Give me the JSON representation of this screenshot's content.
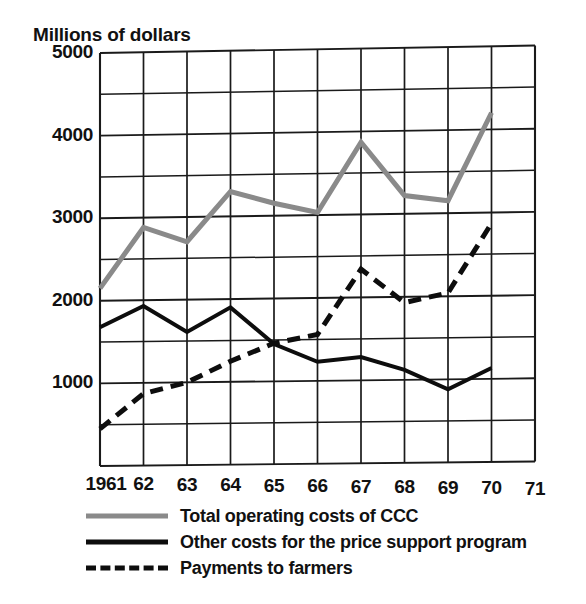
{
  "figure": {
    "axis_title": "Millions of dollars"
  },
  "chart_data": {
    "type": "line",
    "title": "",
    "subtitle": "",
    "xlabel": "",
    "ylabel": "Millions of dollars",
    "grid": true,
    "legend_position": "bottom",
    "xlim": [
      1961,
      1971
    ],
    "ylim": [
      0,
      5000
    ],
    "y_ticks": [
      5000,
      4000,
      3000,
      2000,
      1000
    ],
    "y_tick_labels": [
      "5000",
      "4000",
      "3000",
      "2000",
      "1000"
    ],
    "y_gridline_step": 500,
    "x": [
      1961,
      1962,
      1963,
      1964,
      1965,
      1966,
      1967,
      1968,
      1969,
      1970
    ],
    "x_ticks": [
      1961,
      1962,
      1963,
      1964,
      1965,
      1966,
      1967,
      1968,
      1969,
      1970,
      1971
    ],
    "x_tick_labels": [
      "1961",
      "62",
      "63",
      "64",
      "65",
      "66",
      "67",
      "68",
      "69",
      "70",
      "71"
    ],
    "series": [
      {
        "name": "Total operating costs of CCC",
        "style": "solid",
        "color": "#8a8a8a",
        "width": 5,
        "values": [
          2150,
          2880,
          2700,
          3300,
          3150,
          3030,
          3870,
          3220,
          3150,
          4200
        ]
      },
      {
        "name": "Other costs for the price support program",
        "style": "solid",
        "color": "#0d0d0d",
        "width": 4,
        "values": [
          1680,
          1930,
          1610,
          1900,
          1450,
          1230,
          1280,
          1120,
          880,
          1130
        ]
      },
      {
        "name": "Payments to farmers",
        "style": "dashed",
        "color": "#0d0d0d",
        "width": 5,
        "values": [
          450,
          870,
          1000,
          1250,
          1460,
          1560,
          2340,
          1930,
          2040,
          2870
        ]
      }
    ]
  },
  "legend": {
    "items": [
      {
        "label": "Total operating costs of CCC",
        "swatch": "gray-solid-line-swatch"
      },
      {
        "label": "Other costs for the price support program",
        "swatch": "black-solid-line-swatch"
      },
      {
        "label": "Payments to farmers",
        "swatch": "black-dashed-line-swatch"
      }
    ]
  }
}
